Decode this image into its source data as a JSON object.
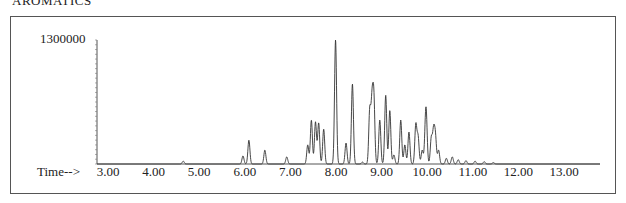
{
  "title": "AROMATICS",
  "chart_data": {
    "type": "line",
    "title": "AROMATICS",
    "xlabel": "Time-->",
    "ylabel": "Abundance",
    "xlim": [
      2.8,
      13.9
    ],
    "ylim": [
      0,
      1300000
    ],
    "y_tick_labels": [
      "1300000"
    ],
    "x_tick_labels": [
      "3.00",
      "4.00",
      "5.00",
      "6.00",
      "7.00",
      "8.00",
      "9.00",
      "10.00",
      "11.00",
      "12.00",
      "13.00"
    ],
    "x_ticks": [
      3,
      4,
      5,
      6,
      7,
      8,
      9,
      10,
      11,
      12,
      13
    ],
    "grid": false,
    "peaks": [
      {
        "t": 4.65,
        "abundance": 30000
      },
      {
        "t": 5.96,
        "abundance": 85000
      },
      {
        "t": 6.09,
        "abundance": 250000
      },
      {
        "t": 6.44,
        "abundance": 145000
      },
      {
        "t": 6.92,
        "abundance": 75000
      },
      {
        "t": 7.38,
        "abundance": 200000
      },
      {
        "t": 7.46,
        "abundance": 460000
      },
      {
        "t": 7.55,
        "abundance": 440000
      },
      {
        "t": 7.62,
        "abundance": 430000
      },
      {
        "t": 7.73,
        "abundance": 365000
      },
      {
        "t": 7.99,
        "abundance": 1300000
      },
      {
        "t": 8.22,
        "abundance": 220000
      },
      {
        "t": 8.36,
        "abundance": 840000
      },
      {
        "t": 8.58,
        "abundance": 20000
      },
      {
        "t": 8.74,
        "abundance": 560000
      },
      {
        "t": 8.79,
        "abundance": 620000
      },
      {
        "t": 8.83,
        "abundance": 670000
      },
      {
        "t": 8.96,
        "abundance": 460000
      },
      {
        "t": 9.09,
        "abundance": 720000
      },
      {
        "t": 9.18,
        "abundance": 560000
      },
      {
        "t": 9.27,
        "abundance": 95000
      },
      {
        "t": 9.42,
        "abundance": 460000
      },
      {
        "t": 9.51,
        "abundance": 200000
      },
      {
        "t": 9.6,
        "abundance": 335000
      },
      {
        "t": 9.75,
        "abundance": 410000
      },
      {
        "t": 9.8,
        "abundance": 280000
      },
      {
        "t": 9.89,
        "abundance": 145000
      },
      {
        "t": 9.96,
        "abundance": 250000
      },
      {
        "t": 9.98,
        "abundance": 410000
      },
      {
        "t": 10.09,
        "abundance": 270000
      },
      {
        "t": 10.14,
        "abundance": 335000
      },
      {
        "t": 10.18,
        "abundance": 280000
      },
      {
        "t": 10.25,
        "abundance": 145000
      },
      {
        "t": 10.42,
        "abundance": 60000
      },
      {
        "t": 10.55,
        "abundance": 75000
      },
      {
        "t": 10.68,
        "abundance": 45000
      },
      {
        "t": 10.85,
        "abundance": 35000
      },
      {
        "t": 11.05,
        "abundance": 30000
      },
      {
        "t": 11.25,
        "abundance": 25000
      },
      {
        "t": 11.45,
        "abundance": 15000
      }
    ]
  }
}
